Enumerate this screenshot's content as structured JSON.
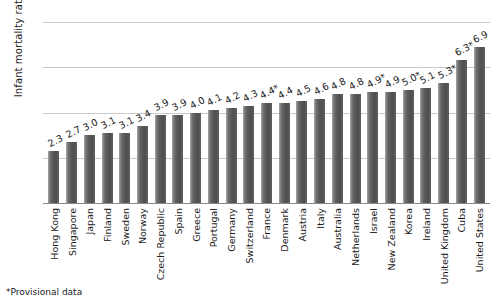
{
  "chart_data": {
    "type": "bar",
    "title": "",
    "xlabel": "",
    "ylabel": "Infant mortality rate",
    "ylim": [
      0,
      8
    ],
    "yticks": [
      "0",
      "2",
      "4",
      "6",
      "8"
    ],
    "grid": true,
    "legend": null,
    "orientation": "vertical",
    "categories": [
      "Hong Kong",
      "Singapore",
      "Japan",
      "Finland",
      "Sweden",
      "Norway",
      "Czech Republic",
      "Spain",
      "Greece",
      "Portugal",
      "Germany",
      "Switzerland",
      "France",
      "Denmark",
      "Austria",
      "Italy",
      "Australia",
      "Netherlands",
      "Israel",
      "New Zealand",
      "Korea",
      "Ireland",
      "United Kingdom",
      "Cuba",
      "United States"
    ],
    "values": [
      2.3,
      2.7,
      3.0,
      3.1,
      3.1,
      3.4,
      3.9,
      3.9,
      4.0,
      4.1,
      4.2,
      4.3,
      4.4,
      4.4,
      4.5,
      4.6,
      4.8,
      4.8,
      4.9,
      4.9,
      5.0,
      5.1,
      5.3,
      6.3,
      6.9
    ],
    "value_labels": [
      "2.3",
      "2.7",
      "3.0",
      "3.1",
      "3.1",
      "3.4",
      "3.9",
      "3.9",
      "4.0",
      "4.1",
      "4.2",
      "4.3",
      "4.4*",
      "4.4",
      "4.5",
      "4.6",
      "4.8",
      "4.8",
      "4.9*",
      "4.9",
      "5.0*",
      "5.1",
      "5.3*",
      "6.3*",
      "6.9"
    ],
    "annotations": [
      "*Provisional data"
    ]
  },
  "footnote": "*Provisional data",
  "colors": {
    "bar": "#5a5a5a",
    "gridline": "#c9c9c9",
    "axis": "#8a8a8a",
    "text": "#1a1a1a",
    "background": "#ffffff"
  }
}
